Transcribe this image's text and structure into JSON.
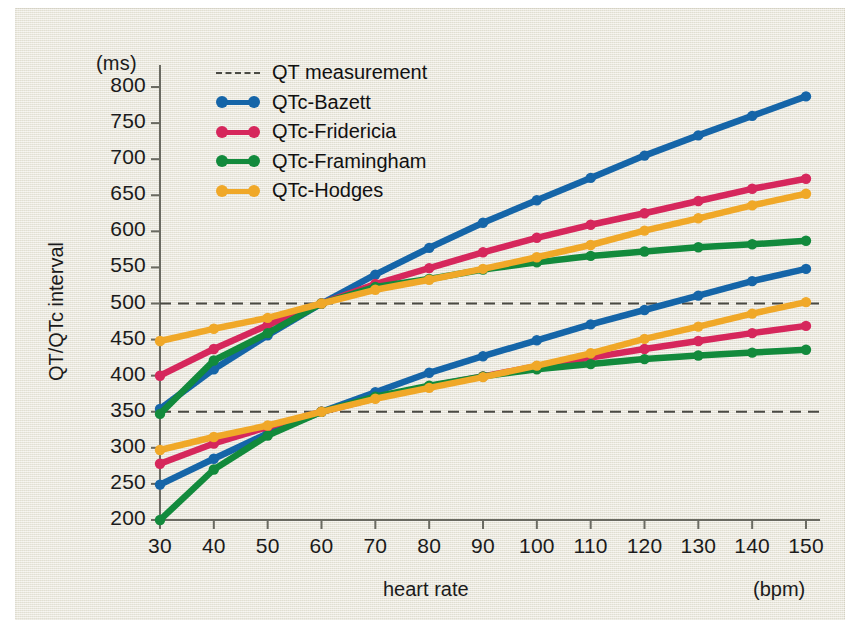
{
  "figure": {
    "background_color": "#eceade",
    "y_unit": "(ms)",
    "x_unit": "(bpm)"
  },
  "legend": {
    "position": "top-left-inside",
    "entries": [
      {
        "label": "QT measurement",
        "color": "#4a4a44",
        "style": "dashed"
      },
      {
        "label": "QTc-Bazett",
        "color": "#1565a8",
        "style": "solid"
      },
      {
        "label": "QTc-Fridericia",
        "color": "#d6275c",
        "style": "solid"
      },
      {
        "label": "QTc-Framingham",
        "color": "#128a3c",
        "style": "solid"
      },
      {
        "label": "QTc-Hodges",
        "color": "#f0a828",
        "style": "solid"
      }
    ]
  },
  "chart_data": {
    "type": "line",
    "title": "",
    "xlabel": "heart rate",
    "ylabel": "QT/QTc interval",
    "x_unit": "(bpm)",
    "y_unit": "(ms)",
    "x": [
      30,
      40,
      50,
      60,
      70,
      80,
      90,
      100,
      110,
      120,
      130,
      140,
      150
    ],
    "xlim": [
      30,
      150
    ],
    "ylim": [
      200,
      800
    ],
    "xticks": [
      30,
      40,
      50,
      60,
      70,
      80,
      90,
      100,
      110,
      120,
      130,
      140,
      150
    ],
    "yticks": [
      200,
      250,
      300,
      350,
      400,
      450,
      500,
      550,
      600,
      650,
      700,
      750,
      800
    ],
    "grid": false,
    "reference_lines": [
      {
        "label": "QT measurement",
        "y": 500,
        "style": "dashed",
        "color": "#4a4a44"
      },
      {
        "label": "QT measurement",
        "y": 350,
        "style": "dashed",
        "color": "#4a4a44"
      }
    ],
    "series": [
      {
        "name": "QTc-Bazett",
        "group": "QT=500ms",
        "color": "#1565a8",
        "values": [
          354,
          409,
          456,
          500,
          540,
          577,
          612,
          643,
          674,
          705,
          733,
          760,
          787
        ]
      },
      {
        "name": "QTc-Fridericia",
        "group": "QT=500ms",
        "color": "#d6275c",
        "values": [
          400,
          437,
          470,
          500,
          527,
          549,
          571,
          591,
          609,
          625,
          642,
          659,
          673
        ]
      },
      {
        "name": "QTc-Framingham",
        "group": "QT=500ms",
        "color": "#128a3c",
        "values": [
          347,
          421,
          459,
          500,
          523,
          534,
          547,
          557,
          566,
          572,
          578,
          582,
          587
        ]
      },
      {
        "name": "QTc-Hodges",
        "group": "QT=500ms",
        "color": "#f0a828",
        "values": [
          448,
          465,
          480,
          500,
          519,
          533,
          548,
          564,
          581,
          601,
          618,
          636,
          652
        ]
      },
      {
        "name": "QTc-Bazett",
        "group": "QT=350ms",
        "color": "#1565a8",
        "values": [
          249,
          285,
          320,
          350,
          377,
          404,
          427,
          449,
          471,
          491,
          511,
          531,
          548
        ]
      },
      {
        "name": "QTc-Fridericia",
        "group": "QT=350ms",
        "color": "#d6275c",
        "values": [
          278,
          306,
          329,
          350,
          369,
          385,
          399,
          413,
          425,
          437,
          448,
          459,
          469
        ]
      },
      {
        "name": "QTc-Framingham",
        "group": "QT=350ms",
        "color": "#128a3c",
        "values": [
          200,
          270,
          317,
          350,
          371,
          386,
          399,
          409,
          416,
          423,
          428,
          432,
          436
        ]
      },
      {
        "name": "QTc-Hodges",
        "group": "QT=350ms",
        "color": "#f0a828",
        "values": [
          297,
          315,
          331,
          350,
          368,
          383,
          398,
          414,
          431,
          451,
          468,
          486,
          502
        ]
      }
    ]
  }
}
